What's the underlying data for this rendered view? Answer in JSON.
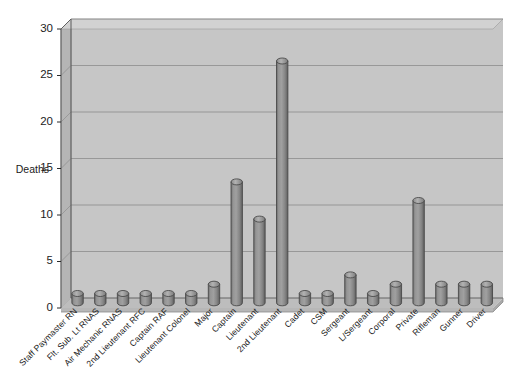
{
  "chart_data": {
    "type": "bar",
    "title": "",
    "xlabel": "",
    "ylabel": "Deaths",
    "ylim": [
      0,
      30
    ],
    "yticks": [
      0,
      5,
      10,
      15,
      20,
      25,
      30
    ],
    "grid": true,
    "legend": false,
    "style": "3d-cylinder-bars",
    "categories": [
      "Staff Paymaster RN",
      "Flt. Sub. Lt RNAS",
      "Air Mechanic RNAS",
      "2nd Lieutenant RFC",
      "Captain RAF",
      "Lieutenant Colonel",
      "Major",
      "Captain",
      "Lieutenant",
      "2nd Lieutenant",
      "Cadet",
      "CSM",
      "Sergeant",
      "L/Sergeant",
      "Corporal",
      "Private",
      "Rifleman",
      "Gunner",
      "Driver"
    ],
    "values": [
      1,
      1,
      1,
      1,
      1,
      1,
      2,
      13,
      9,
      26,
      1,
      1,
      3,
      1,
      2,
      11,
      2,
      2,
      2
    ],
    "colors": {
      "plot_background": "#c6c6c6",
      "wall_side": "#b5b5b5",
      "floor": "#bdbdbd",
      "bar_fill": "#8c8c8c",
      "bar_edge": "#4a4a4a",
      "gridline": "#7e7e7e",
      "axis": "#5a5a5a",
      "text": "#1c1c1c",
      "page_background": "#ffffff"
    }
  }
}
